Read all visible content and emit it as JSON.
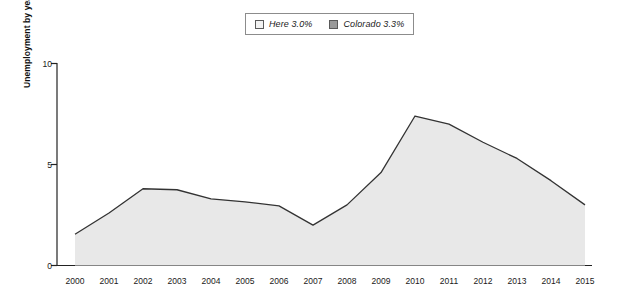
{
  "legend": {
    "entries": [
      {
        "label": "Here 3.0%",
        "swatch": "light-swatch-icon",
        "color": "#f2f2f2"
      },
      {
        "label": "Colorado 3.3%",
        "swatch": "gray-swatch-icon",
        "color": "#9a9a9a"
      }
    ]
  },
  "axes": {
    "y_title": "Unemployment by year (%)",
    "y_ticks": [
      "0",
      "5",
      "10"
    ],
    "x_ticks": [
      "2000",
      "2001",
      "2002",
      "2003",
      "2004",
      "2005",
      "2006",
      "2007",
      "2008",
      "2009",
      "2010",
      "2011",
      "2012",
      "2013",
      "2014",
      "2015"
    ]
  },
  "chart_data": {
    "type": "area",
    "title": "",
    "xlabel": "",
    "ylabel": "Unemployment by year (%)",
    "ylim": [
      0,
      10
    ],
    "grid": false,
    "legend_position": "top-center",
    "categories": [
      "2000",
      "2001",
      "2002",
      "2003",
      "2004",
      "2005",
      "2006",
      "2007",
      "2008",
      "2009",
      "2010",
      "2011",
      "2012",
      "2013",
      "2014",
      "2015"
    ],
    "series": [
      {
        "name": "Here",
        "legend_value": "3.0%",
        "fill": "#e8e8e8",
        "line": "#333333",
        "values": [
          1.55,
          2.6,
          3.8,
          3.75,
          3.3,
          3.15,
          2.95,
          2.0,
          3.0,
          4.6,
          7.4,
          7.0,
          6.1,
          5.3,
          4.2,
          3.0
        ]
      }
    ],
    "annotations": []
  }
}
